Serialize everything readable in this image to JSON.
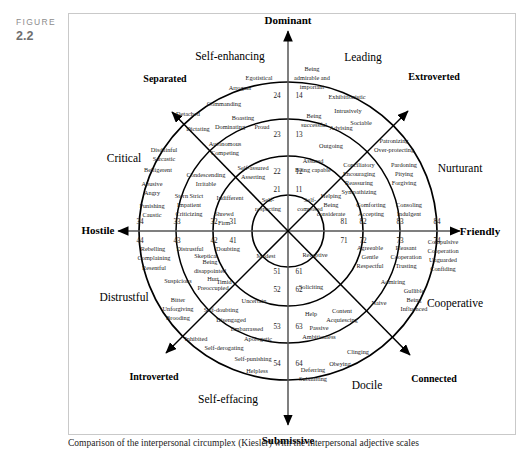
{
  "figure": {
    "word": "FIGURE",
    "number": "2.2"
  },
  "caption": "Comparison of the interpersonal circumplex (Kiesler) with the interpersonal adjective scales",
  "chart_data": {
    "type": "diagram",
    "title": "Interpersonal circumplex",
    "center": {
      "x": 288,
      "y": 231
    },
    "ring_radii": [
      36,
      75,
      112,
      149
    ],
    "axes": [
      {
        "name": "Dominant",
        "angle_deg": 90
      },
      {
        "name": "Friendly",
        "angle_deg": 0
      },
      {
        "name": "Submissive",
        "angle_deg": 270
      },
      {
        "name": "Hostile",
        "angle_deg": 180
      }
    ],
    "diagonals": [
      {
        "name": "Separated",
        "angle_deg": 135
      },
      {
        "name": "Extroverted",
        "angle_deg": 45
      },
      {
        "name": "Connected",
        "angle_deg": 315
      },
      {
        "name": "Introverted",
        "angle_deg": 225
      }
    ],
    "octants": [
      {
        "name": "Self-enhancing",
        "angle_deg": 112
      },
      {
        "name": "Leading",
        "angle_deg": 68
      },
      {
        "name": "Nurturant",
        "angle_deg": 23
      },
      {
        "name": "Cooperative",
        "angle_deg": -23
      },
      {
        "name": "Docile",
        "angle_deg": -68
      },
      {
        "name": "Self-effacing",
        "angle_deg": -112
      },
      {
        "name": "Distrustful",
        "angle_deg": 203
      },
      {
        "name": "Critical",
        "angle_deg": 157
      }
    ]
  },
  "axis_labels": [
    {
      "id": "dominant",
      "text": "Dominant"
    },
    {
      "id": "friendly",
      "text": "Friendly"
    },
    {
      "id": "submissive",
      "text": "Submissive"
    },
    {
      "id": "hostile",
      "text": "Hostile"
    }
  ],
  "diagonal_labels": [
    {
      "id": "separated",
      "text": "Separated"
    },
    {
      "id": "extroverted",
      "text": "Extroverted"
    },
    {
      "id": "connected",
      "text": "Connected"
    },
    {
      "id": "introverted",
      "text": "Introverted"
    }
  ],
  "octant_labels": [
    {
      "id": "self-enhancing",
      "text": "Self-enhancing"
    },
    {
      "id": "leading",
      "text": "Leading"
    },
    {
      "id": "nurturant",
      "text": "Nurturant"
    },
    {
      "id": "cooperative",
      "text": "Cooperative"
    },
    {
      "id": "docile",
      "text": "Docile"
    },
    {
      "id": "self-effacing",
      "text": "Self-effacing"
    },
    {
      "id": "distrustful",
      "text": "Distrustful"
    },
    {
      "id": "critical",
      "text": "Critical"
    }
  ],
  "ring_numbers": [
    {
      "id": "n24",
      "text": "24"
    },
    {
      "id": "n14",
      "text": "14"
    },
    {
      "id": "n23",
      "text": "23"
    },
    {
      "id": "n13",
      "text": "13"
    },
    {
      "id": "n22",
      "text": "22"
    },
    {
      "id": "n12",
      "text": "12"
    },
    {
      "id": "n21",
      "text": "21"
    },
    {
      "id": "n11",
      "text": "11"
    },
    {
      "id": "n34",
      "text": "34"
    },
    {
      "id": "n33",
      "text": "33"
    },
    {
      "id": "n32",
      "text": "32"
    },
    {
      "id": "n31",
      "text": "31"
    },
    {
      "id": "n44",
      "text": "44"
    },
    {
      "id": "n43",
      "text": "43"
    },
    {
      "id": "n42",
      "text": "42"
    },
    {
      "id": "n41",
      "text": "41"
    },
    {
      "id": "n81",
      "text": "81"
    },
    {
      "id": "n82",
      "text": "82"
    },
    {
      "id": "n83",
      "text": "83"
    },
    {
      "id": "n84",
      "text": "84"
    },
    {
      "id": "n71",
      "text": "71"
    },
    {
      "id": "n72",
      "text": "72"
    },
    {
      "id": "n73",
      "text": "73"
    },
    {
      "id": "n74",
      "text": "74"
    },
    {
      "id": "n51",
      "text": "51"
    },
    {
      "id": "n61",
      "text": "61"
    },
    {
      "id": "n52",
      "text": "52"
    },
    {
      "id": "n62",
      "text": "62"
    },
    {
      "id": "n53",
      "text": "53"
    },
    {
      "id": "n63",
      "text": "63"
    },
    {
      "id": "n54",
      "text": "54"
    },
    {
      "id": "n64",
      "text": "64"
    }
  ],
  "traits": [
    {
      "id": "t-egotistical",
      "text": "Egotistical"
    },
    {
      "id": "t-arrogant",
      "text": "Arrogant"
    },
    {
      "id": "t-commanding",
      "text": "Commanding"
    },
    {
      "id": "t-boasting",
      "text": "Boasting"
    },
    {
      "id": "t-dominating",
      "text": "Dominating"
    },
    {
      "id": "t-proud",
      "text": "Proud"
    },
    {
      "id": "t-autonomous-competing",
      "text": "Autonomous\nCompeting"
    },
    {
      "id": "t-self-assured-asserting",
      "text": "Self-assured\nAsserting"
    },
    {
      "id": "t-self-respecting",
      "text": "Self-\nrespecting"
    },
    {
      "id": "t-being-admirable",
      "text": "Being\nadmirable and\nimportant"
    },
    {
      "id": "t-exhibitionistic",
      "text": "Exhibitionistic"
    },
    {
      "id": "t-being-successful",
      "text": "Being\nsuccessful"
    },
    {
      "id": "t-intrusively",
      "text": "Intrusively"
    },
    {
      "id": "t-advising",
      "text": "Advising"
    },
    {
      "id": "t-sociable",
      "text": "Sociable"
    },
    {
      "id": "t-outgoing",
      "text": "Outgoing"
    },
    {
      "id": "t-assured-being-capable",
      "text": "Assured\nBeing capable"
    },
    {
      "id": "t-self-composed",
      "text": "Self-\ncomposed"
    },
    {
      "id": "t-patronizing",
      "text": "Patronizing"
    },
    {
      "id": "t-over-protecting",
      "text": "Over-protecting"
    },
    {
      "id": "t-conciliatory",
      "text": "Conciliatory\nEncouraging\nReassuring\nSympathizing"
    },
    {
      "id": "t-pardoning",
      "text": "Pardoning\nPitying\nForgiving"
    },
    {
      "id": "t-helping",
      "text": "Helping\nBeing\nconsiderate"
    },
    {
      "id": "t-comforting",
      "text": "Comforting\nAccepting"
    },
    {
      "id": "t-consoling",
      "text": "Consoling\nIndulgent"
    },
    {
      "id": "t-agreeable",
      "text": "Agreeable\nGentle\nRespectful"
    },
    {
      "id": "t-pleasant",
      "text": "Pleasant\nCooperation\nTrusting"
    },
    {
      "id": "t-compulsive",
      "text": "Compulsive\nCooperation\nUnguarded\nConfiding"
    },
    {
      "id": "t-receptive",
      "text": "Receptive"
    },
    {
      "id": "t-admiring",
      "text": "Admiring"
    },
    {
      "id": "t-gullible",
      "text": "Gullible\nBeing\nInfluenced"
    },
    {
      "id": "t-naive",
      "text": "Naive"
    },
    {
      "id": "t-content",
      "text": "Content\nAcquiescing"
    },
    {
      "id": "t-passive",
      "text": "Passive\nAmbitionless"
    },
    {
      "id": "t-soliciting",
      "text": "Soliciting\n\nHelp"
    },
    {
      "id": "t-clinging",
      "text": "Clinging"
    },
    {
      "id": "t-obeying",
      "text": "Obeying"
    },
    {
      "id": "t-deferring",
      "text": "Deferring\nSubmitting"
    },
    {
      "id": "t-helpless",
      "text": "Helpless"
    },
    {
      "id": "t-self-punishing",
      "text": "Self-punishing"
    },
    {
      "id": "t-self-derogating",
      "text": "Self-derogating"
    },
    {
      "id": "t-apologetic",
      "text": "Apologetic"
    },
    {
      "id": "t-embarrassed",
      "text": "Embarrassed"
    },
    {
      "id": "t-disengaged",
      "text": "Disengaged"
    },
    {
      "id": "t-self-doubting",
      "text": "Self-doubting"
    },
    {
      "id": "t-inhibited",
      "text": "Inhibited"
    },
    {
      "id": "t-uncertain",
      "text": "Uncertain"
    },
    {
      "id": "t-modest",
      "text": "Modest"
    },
    {
      "id": "t-timid",
      "text": "Timid"
    },
    {
      "id": "t-brooding",
      "text": "Brooding"
    },
    {
      "id": "t-unforgiving",
      "text": "Unforgiving"
    },
    {
      "id": "t-bitter",
      "text": "Bitter"
    },
    {
      "id": "t-preoccupied",
      "text": "Preoccupied"
    },
    {
      "id": "t-hurt",
      "text": "Hurt"
    },
    {
      "id": "t-being-disappointed",
      "text": "Being\ndisappointed"
    },
    {
      "id": "t-suspicious",
      "text": "Suspicious"
    },
    {
      "id": "t-skeptical",
      "text": "Skeptical"
    },
    {
      "id": "t-distrustful-trait",
      "text": "Distrustful"
    },
    {
      "id": "t-doubting",
      "text": "Doubting"
    },
    {
      "id": "t-resentful",
      "text": "Resentful"
    },
    {
      "id": "t-complaining",
      "text": "Complaining"
    },
    {
      "id": "t-rebelling",
      "text": "Rebelling"
    },
    {
      "id": "t-punishing-caustic",
      "text": "Punishing\nCaustic"
    },
    {
      "id": "t-stern-strict",
      "text": "Stern  Strict\nImpatient\nCriticizing"
    },
    {
      "id": "t-indifferent",
      "text": "Indifferent"
    },
    {
      "id": "t-shrewd-firm",
      "text": "Shrewd\nFirm"
    },
    {
      "id": "t-abusive-angry",
      "text": "Abusive\nAngry"
    },
    {
      "id": "t-belligerent",
      "text": "Belligerent"
    },
    {
      "id": "t-disdainful-sarcastic",
      "text": "Disdainful\nSarcastic"
    },
    {
      "id": "t-condescending-irritable",
      "text": "Condescending\nIrritable"
    },
    {
      "id": "t-detached",
      "text": "Detached"
    },
    {
      "id": "t-dictating",
      "text": "Dictating"
    }
  ]
}
